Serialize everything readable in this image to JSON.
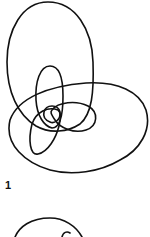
{
  "figures": [
    {
      "label": "1",
      "description": "closed curve drawing with large upper oval, large lower oval and inner overlapping petal loops"
    },
    {
      "label": "",
      "description": "partially visible next curve drawing (cut off at bottom)"
    }
  ],
  "colors": {
    "stroke": "#111111",
    "background": "#ffffff"
  }
}
